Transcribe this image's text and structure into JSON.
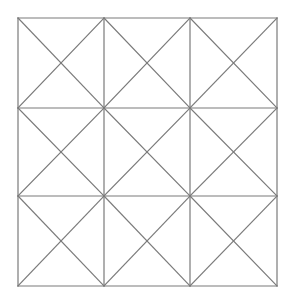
{
  "diagram": {
    "type": "grid-with-diagonals",
    "rows": 3,
    "cols": 3,
    "bounds": {
      "x0": 18,
      "y0": 18,
      "x1": 277,
      "y1": 286
    },
    "col_lines_x": [
      18,
      104,
      190,
      277
    ],
    "row_lines_y": [
      18,
      108,
      196,
      286
    ],
    "cell_diagonals": "both",
    "colors": {
      "line": "#7a7a7a",
      "background": "#ffffff"
    },
    "stroke_width": 1.2
  }
}
